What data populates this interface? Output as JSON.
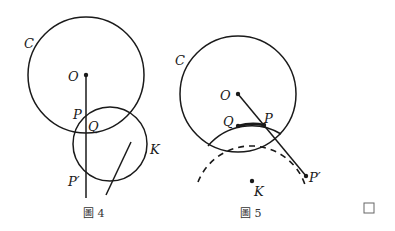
{
  "figure4": {
    "caption": "圖 4",
    "labels": {
      "circle_c": "C",
      "center_o": "O",
      "point_p": "P",
      "point_q": "Q",
      "point_p_prime": "P′",
      "circle_k": "K"
    }
  },
  "figure5": {
    "caption": "圖 5",
    "labels": {
      "circle_c": "C",
      "center_o": "O",
      "point_p": "P",
      "point_q": "Q",
      "point_p_prime": "P′",
      "center_k": "K"
    }
  },
  "end_mark": "□",
  "colors": {
    "ink": "#1a1a1a",
    "caption": "#333333"
  }
}
